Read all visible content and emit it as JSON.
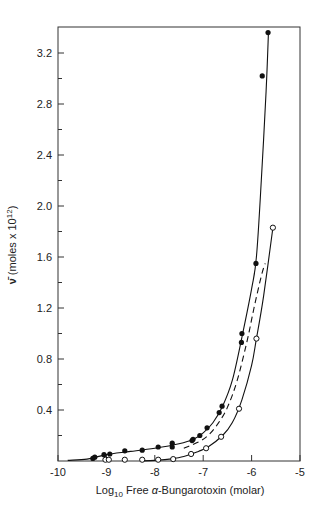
{
  "chart_data": {
    "type": "scatter",
    "title": "",
    "xlabel": "Log10 Free α-Bungarotoxin (molar)",
    "xlabel_parts": {
      "pre": "Log",
      "sub": "10",
      "post": " Free ",
      "greek": "α",
      "tail": "-Bungarotoxin (molar)"
    },
    "ylabel": "ν̄ (moles x 10^12)",
    "ylabel_parts": {
      "sym": "ν̄",
      "pre": " (moles x 10",
      "sup": "12",
      "post": ")"
    },
    "xlim": [
      -10,
      -5
    ],
    "ylim": [
      0,
      3.4
    ],
    "x_ticks": [
      -10,
      -9,
      -8,
      -7,
      -6,
      -5
    ],
    "x_tick_labels": [
      "-10",
      "-9",
      "-8",
      "-7",
      "-6",
      "-5"
    ],
    "y_ticks_major": [
      0.4,
      0.8,
      1.2,
      1.6,
      2.0,
      2.4,
      2.8,
      3.2
    ],
    "y_tick_labels": [
      "0.4",
      "0.8",
      "1.2",
      "1.6",
      "2.0",
      "2.4",
      "2.8",
      "3.2"
    ],
    "y_ticks_minor": [
      0.2,
      0.6,
      1.0,
      1.4,
      1.8,
      2.2,
      2.6,
      3.0
    ],
    "grid": false,
    "legend": null,
    "series": [
      {
        "name": "filled circles",
        "marker": "filled-circle",
        "line": "solid",
        "points": [
          [
            -9.28,
            0.02
          ],
          [
            -9.24,
            0.03
          ],
          [
            -9.05,
            0.05
          ],
          [
            -8.93,
            0.055
          ],
          [
            -8.62,
            0.08
          ],
          [
            -8.26,
            0.085
          ],
          [
            -7.93,
            0.11
          ],
          [
            -7.64,
            0.14
          ],
          [
            -7.64,
            0.11
          ],
          [
            -7.23,
            0.16
          ],
          [
            -7.21,
            0.17
          ],
          [
            -7.07,
            0.2
          ],
          [
            -6.92,
            0.26
          ],
          [
            -6.67,
            0.38
          ],
          [
            -6.61,
            0.43
          ],
          [
            -6.21,
            0.93
          ],
          [
            -6.2,
            1.0
          ],
          [
            -5.91,
            1.55
          ],
          [
            -5.78,
            3.02
          ],
          [
            -5.66,
            3.36
          ]
        ],
        "curve": [
          [
            -9.8,
            0.005
          ],
          [
            -9.4,
            0.015
          ],
          [
            -9.0,
            0.05
          ],
          [
            -8.5,
            0.075
          ],
          [
            -8.0,
            0.1
          ],
          [
            -7.5,
            0.135
          ],
          [
            -7.2,
            0.17
          ],
          [
            -7.0,
            0.22
          ],
          [
            -6.8,
            0.3
          ],
          [
            -6.6,
            0.43
          ],
          [
            -6.4,
            0.63
          ],
          [
            -6.2,
            0.97
          ],
          [
            -6.0,
            1.35
          ],
          [
            -5.9,
            1.6
          ],
          [
            -5.8,
            2.2
          ],
          [
            -5.7,
            2.9
          ],
          [
            -5.65,
            3.37
          ]
        ]
      },
      {
        "name": "open circles",
        "marker": "open-circle",
        "line": "solid",
        "points": [
          [
            -9.02,
            0.01
          ],
          [
            -8.95,
            0.01
          ],
          [
            -8.62,
            0.01
          ],
          [
            -8.26,
            0.01
          ],
          [
            -7.93,
            0.01
          ],
          [
            -7.62,
            0.015
          ],
          [
            -7.25,
            0.055
          ],
          [
            -6.94,
            0.1
          ],
          [
            -6.63,
            0.19
          ],
          [
            -6.26,
            0.41
          ],
          [
            -5.9,
            0.96
          ],
          [
            -5.56,
            1.83
          ]
        ],
        "curve": [
          [
            -8.3,
            0.0
          ],
          [
            -8.0,
            0.005
          ],
          [
            -7.7,
            0.015
          ],
          [
            -7.4,
            0.035
          ],
          [
            -7.1,
            0.075
          ],
          [
            -6.9,
            0.11
          ],
          [
            -6.6,
            0.2
          ],
          [
            -6.4,
            0.3
          ],
          [
            -6.2,
            0.48
          ],
          [
            -6.0,
            0.75
          ],
          [
            -5.9,
            0.96
          ],
          [
            -5.75,
            1.3
          ],
          [
            -5.56,
            1.83
          ]
        ]
      },
      {
        "name": "dashed curve",
        "marker": "none",
        "line": "dashed",
        "curve": [
          [
            -7.4,
            0.1
          ],
          [
            -7.1,
            0.15
          ],
          [
            -6.9,
            0.2
          ],
          [
            -6.7,
            0.29
          ],
          [
            -6.5,
            0.42
          ],
          [
            -6.3,
            0.63
          ],
          [
            -6.1,
            0.93
          ],
          [
            -5.95,
            1.2
          ],
          [
            -5.8,
            1.45
          ],
          [
            -5.72,
            1.55
          ]
        ]
      }
    ]
  }
}
